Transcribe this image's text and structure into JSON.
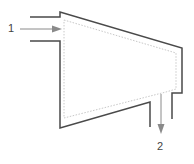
{
  "diagram": {
    "type": "flow-vessel",
    "labels": {
      "inlet": "1",
      "outlet": "2"
    },
    "colors": {
      "outline": "#4a4a4a",
      "arrow": "#8a8a8a",
      "dotted": "#c8c8c8",
      "text": "#444444"
    },
    "arrows": [
      {
        "id": "inlet-arrow",
        "from": [
          20,
          29
        ],
        "to": [
          62,
          29
        ],
        "label": "1"
      },
      {
        "id": "outlet-arrow",
        "from": [
          161,
          94
        ],
        "to": [
          161,
          134
        ],
        "label": "2"
      }
    ]
  }
}
